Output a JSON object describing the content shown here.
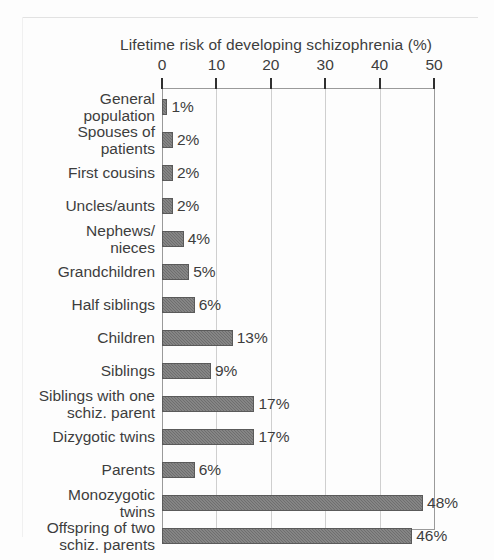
{
  "figure": {
    "name": "lifetime-risk-of-schizophrenia-bar-chart"
  },
  "chart_data": {
    "type": "bar",
    "orientation": "horizontal",
    "title": "Lifetime risk of  developing schizophrenia (%)",
    "xlabel": "",
    "ylabel": "",
    "xlim": [
      0,
      50
    ],
    "xticks": [
      0,
      10,
      20,
      30,
      40,
      50
    ],
    "xtick_labels": [
      "0",
      "10",
      "20",
      "30",
      "40",
      "50"
    ],
    "grid": true,
    "legend": false,
    "bar_color": "#6e6e6e",
    "categories": [
      "General population",
      "Spouses of patients",
      "First cousins",
      "Uncles/aunts",
      "Nephews/nieces",
      "Grandchildren",
      "Half siblings",
      "Children",
      "Siblings",
      "Siblings with one schiz. parent",
      "Dizygotic twins",
      "Parents",
      "Monozygotic twins",
      "Offspring of two schiz. parents"
    ],
    "values": [
      1,
      2,
      2,
      2,
      4,
      5,
      6,
      13,
      9,
      17,
      17,
      6,
      48,
      46
    ],
    "value_labels": [
      "1%",
      "2%",
      "2%",
      "2%",
      "4%",
      "5%",
      "6%",
      "13%",
      "9%",
      "17%",
      "17%",
      "6%",
      "48%",
      "46%"
    ],
    "rows": [
      {
        "label_lines": [
          "General",
          "population"
        ],
        "value": 1,
        "value_label": "1%"
      },
      {
        "label_lines": [
          "Spouses of",
          "patients"
        ],
        "value": 2,
        "value_label": "2%"
      },
      {
        "label_lines": [
          "First cousins"
        ],
        "value": 2,
        "value_label": "2%"
      },
      {
        "label_lines": [
          "Uncles/aunts"
        ],
        "value": 2,
        "value_label": "2%"
      },
      {
        "label_lines": [
          "Nephews/",
          "nieces"
        ],
        "value": 4,
        "value_label": "4%"
      },
      {
        "label_lines": [
          "Grandchildren"
        ],
        "value": 5,
        "value_label": "5%"
      },
      {
        "label_lines": [
          "Half siblings"
        ],
        "value": 6,
        "value_label": "6%"
      },
      {
        "label_lines": [
          "Children"
        ],
        "value": 13,
        "value_label": "13%"
      },
      {
        "label_lines": [
          "Siblings"
        ],
        "value": 9,
        "value_label": "9%"
      },
      {
        "label_lines": [
          "Siblings with one",
          "schiz. parent"
        ],
        "value": 17,
        "value_label": "17%"
      },
      {
        "label_lines": [
          "Dizygotic twins"
        ],
        "value": 17,
        "value_label": "17%"
      },
      {
        "label_lines": [
          "Parents"
        ],
        "value": 6,
        "value_label": "6%"
      },
      {
        "label_lines": [
          "Monozygotic",
          "twins"
        ],
        "value": 48,
        "value_label": "48%"
      },
      {
        "label_lines": [
          "Offspring of two",
          "schiz. parents"
        ],
        "value": 46,
        "value_label": "46%"
      }
    ]
  }
}
